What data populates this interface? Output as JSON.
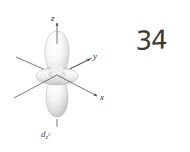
{
  "figure": {
    "name": "d-z-squared atomic orbital diagram",
    "background_color": "#ffffff",
    "caption": {
      "symbol": "d",
      "subscript": "z",
      "superscript": "2",
      "full_text": "d z2"
    },
    "axes": [
      {
        "id": "z",
        "label": "z",
        "direction": "up",
        "has_arrow": true
      },
      {
        "id": "y",
        "label": "y",
        "direction": "upper-right",
        "has_arrow": true
      },
      {
        "id": "x",
        "label": "x",
        "direction": "lower-right",
        "has_arrow": true
      },
      {
        "id": "-z",
        "label": "",
        "direction": "down",
        "has_arrow": false
      },
      {
        "id": "-y",
        "label": "",
        "direction": "lower-left",
        "has_arrow": false
      },
      {
        "id": "-x",
        "label": "",
        "direction": "upper-left",
        "has_arrow": false
      }
    ],
    "lobes": [
      {
        "id": "upper-lobe",
        "orientation": "up",
        "shape": "elongated-teardrop"
      },
      {
        "id": "lower-lobe",
        "orientation": "down",
        "shape": "elongated-teardrop"
      },
      {
        "id": "torus",
        "orientation": "equatorial",
        "shape": "ring"
      }
    ],
    "colors": {
      "axis_line": "#555555",
      "lobe_fill_light": "#ffffff",
      "lobe_fill_shadow": "#c9c9c9",
      "lobe_outline": "#b8b8b8",
      "label_text": "#2b2b2b",
      "caption_text": "#4a4a4a",
      "annotation_ink": "#3a3a3a"
    }
  },
  "annotation": {
    "text": "34",
    "kind": "handwritten-page-number"
  }
}
